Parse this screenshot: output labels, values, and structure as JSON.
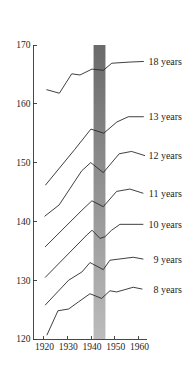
{
  "chart_data": {
    "type": "line",
    "title": "",
    "xlabel": "",
    "ylabel": "",
    "xlim": [
      1915.5,
      1963.5
    ],
    "ylim": [
      120,
      170
    ],
    "grid": false,
    "legend": "none - each series labelled at the right end of its line",
    "x_ticks": [
      1920,
      1930,
      1940,
      1950,
      1960
    ],
    "x_tick_labels": [
      "1920",
      "1930",
      "1940",
      "1950",
      "1960"
    ],
    "y_ticks": [
      120,
      130,
      140,
      150,
      160,
      170
    ],
    "y_tick_labels": [
      "120",
      "130",
      "140",
      "150",
      "160",
      "170"
    ],
    "shaded_band": {
      "x_from": 1941,
      "x_to": 1946,
      "y_from": 120,
      "y_to": 170,
      "color_top": "#6a6a6a",
      "color_bottom": "#bcbcbc"
    },
    "line_color": "#2a2a2a",
    "text_color": "#1e1e1e",
    "series": [
      {
        "name": "18 years",
        "points": [
          [
            1921.3,
            162.4
          ],
          [
            1926.6,
            161.8
          ],
          [
            1931.8,
            165.1
          ],
          [
            1935.3,
            164.9
          ],
          [
            1940.3,
            165.9
          ],
          [
            1945.1,
            165.7
          ],
          [
            1948.7,
            166.9
          ],
          [
            1956.3,
            167.1
          ],
          [
            1962.0,
            167.2
          ]
        ]
      },
      {
        "name": "13 years",
        "points": [
          [
            1920.8,
            146.2
          ],
          [
            1933.0,
            152.2
          ],
          [
            1939.9,
            155.7
          ],
          [
            1945.3,
            155.0
          ],
          [
            1950.8,
            156.9
          ],
          [
            1955.6,
            157.8
          ],
          [
            1962.0,
            157.8
          ]
        ]
      },
      {
        "name": "12 years",
        "points": [
          [
            1920.5,
            140.9
          ],
          [
            1926.5,
            142.8
          ],
          [
            1936.0,
            148.6
          ],
          [
            1939.8,
            150.0
          ],
          [
            1945.1,
            148.3
          ],
          [
            1951.8,
            151.5
          ],
          [
            1957.0,
            151.9
          ],
          [
            1962.5,
            151.2
          ]
        ]
      },
      {
        "name": "11 years",
        "points": [
          [
            1920.7,
            135.7
          ],
          [
            1936.1,
            141.9
          ],
          [
            1940.3,
            143.5
          ],
          [
            1945.1,
            142.5
          ],
          [
            1950.7,
            145.1
          ],
          [
            1956.3,
            145.5
          ],
          [
            1961.8,
            144.8
          ]
        ]
      },
      {
        "name": "10 years",
        "points": [
          [
            1920.7,
            130.5
          ],
          [
            1938.2,
            137.7
          ],
          [
            1940.4,
            138.5
          ],
          [
            1943.7,
            137.1
          ],
          [
            1945.8,
            137.4
          ],
          [
            1948.6,
            138.5
          ],
          [
            1952.1,
            139.5
          ],
          [
            1961.8,
            139.5
          ]
        ]
      },
      {
        "name": "9 years",
        "points": [
          [
            1920.7,
            125.8
          ],
          [
            1930.5,
            130.0
          ],
          [
            1936.1,
            131.4
          ],
          [
            1939.5,
            133.0
          ],
          [
            1945.1,
            131.8
          ],
          [
            1947.9,
            133.4
          ],
          [
            1957.7,
            133.9
          ],
          [
            1961.8,
            133.6
          ]
        ]
      },
      {
        "name": "8 years",
        "points": [
          [
            1921.4,
            120.7
          ],
          [
            1926.0,
            124.8
          ],
          [
            1930.5,
            125.1
          ],
          [
            1934.6,
            126.3
          ],
          [
            1939.5,
            127.7
          ],
          [
            1944.4,
            126.9
          ],
          [
            1947.9,
            128.2
          ],
          [
            1950.7,
            128.0
          ],
          [
            1957.7,
            128.8
          ],
          [
            1961.4,
            128.5
          ]
        ]
      }
    ]
  }
}
